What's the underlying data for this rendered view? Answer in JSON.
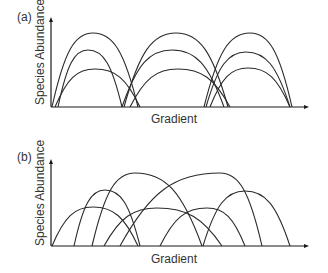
{
  "figure": {
    "panels": [
      {
        "id": "a",
        "label": "(a)",
        "ylabel": "Species Abundance",
        "xlabel": "Gradient",
        "description": "Discrete communities: species curves cluster into three groups along the gradient"
      },
      {
        "id": "b",
        "label": "(b)",
        "ylabel": "Species Abundance",
        "xlabel": "Gradient",
        "description": "Continuum: species curves overlap individually along the gradient"
      }
    ],
    "line_color": "#2a2a2a",
    "axis_color": "#1a1a1a"
  },
  "chart_data": [
    {
      "type": "line",
      "title": "(a)",
      "xlabel": "Gradient",
      "ylabel": "Species Abundance",
      "grid": false,
      "series": [
        {
          "name": "group1-tall",
          "start": 52,
          "end": 138,
          "peak_x": 93,
          "peak_y": 33
        },
        {
          "name": "group1-mid",
          "start": 58,
          "end": 122,
          "peak_x": 88,
          "peak_y": 50
        },
        {
          "name": "group1-short",
          "start": 55,
          "end": 140,
          "peak_x": 95,
          "peak_y": 69
        },
        {
          "name": "group2-tall",
          "start": 124,
          "end": 228,
          "peak_x": 176,
          "peak_y": 33
        },
        {
          "name": "group2-mid",
          "start": 122,
          "end": 224,
          "peak_x": 172,
          "peak_y": 50
        },
        {
          "name": "group2-short",
          "start": 130,
          "end": 230,
          "peak_x": 178,
          "peak_y": 69
        },
        {
          "name": "group3-tall",
          "start": 204,
          "end": 292,
          "peak_x": 250,
          "peak_y": 33
        },
        {
          "name": "group3-mid",
          "start": 206,
          "end": 290,
          "peak_x": 246,
          "peak_y": 52
        },
        {
          "name": "group3-short",
          "start": 210,
          "end": 290,
          "peak_x": 248,
          "peak_y": 68
        }
      ],
      "baseline_y": 107
    },
    {
      "type": "line",
      "title": "(b)",
      "xlabel": "Gradient",
      "ylabel": "Species Abundance",
      "grid": false,
      "series": [
        {
          "name": "species1",
          "start": 52,
          "end": 138,
          "peak_x": 93,
          "peak_y": 207
        },
        {
          "name": "species2",
          "start": 74,
          "end": 140,
          "peak_x": 105,
          "peak_y": 190
        },
        {
          "name": "species3",
          "start": 92,
          "end": 202,
          "peak_x": 135,
          "peak_y": 173
        },
        {
          "name": "species4",
          "start": 104,
          "end": 222,
          "peak_x": 157,
          "peak_y": 208
        },
        {
          "name": "species5",
          "start": 120,
          "end": 262,
          "peak_x": 220,
          "peak_y": 173
        },
        {
          "name": "species6",
          "start": 160,
          "end": 245,
          "peak_x": 207,
          "peak_y": 208
        },
        {
          "name": "species7",
          "start": 203,
          "end": 290,
          "peak_x": 245,
          "peak_y": 191
        }
      ],
      "baseline_y": 246
    }
  ]
}
